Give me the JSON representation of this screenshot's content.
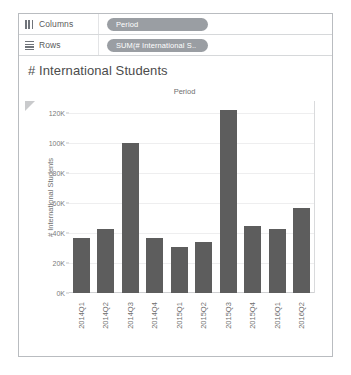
{
  "shelves": [
    {
      "label": "Columns",
      "icon": "columns-icon",
      "pill": "Period"
    },
    {
      "label": "Rows",
      "icon": "rows-icon",
      "pill": "SUM(# International S.."
    }
  ],
  "chart_data": {
    "type": "bar",
    "title": "# International Students",
    "column_header": "Period",
    "xlabel": "",
    "ylabel": "# International Students",
    "categories": [
      "2014Q1",
      "2014Q2",
      "2014Q3",
      "2014Q4",
      "2015Q1",
      "2015Q2",
      "2015Q3",
      "2015Q4",
      "2016Q1",
      "2016Q2"
    ],
    "values": [
      37000,
      43000,
      100000,
      37000,
      31000,
      34000,
      122000,
      45000,
      43000,
      57000
    ],
    "ylim": [
      0,
      128000
    ],
    "yticks": [
      0,
      20000,
      40000,
      60000,
      80000,
      100000,
      120000
    ],
    "ytick_labels": [
      "0K",
      "20K",
      "40K",
      "60K",
      "80K",
      "100K",
      "120K"
    ],
    "grid": true,
    "legend": "none",
    "bar_color": "#5d5d5d"
  },
  "markers": {
    "collapse_triangle": "collapse-triangle-icon"
  }
}
